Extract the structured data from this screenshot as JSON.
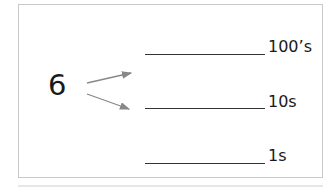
{
  "diagram": {
    "number": "6",
    "arrow_color": "#888888",
    "places": [
      {
        "label": "100’s"
      },
      {
        "label": "10s"
      },
      {
        "label": "1s"
      }
    ]
  }
}
